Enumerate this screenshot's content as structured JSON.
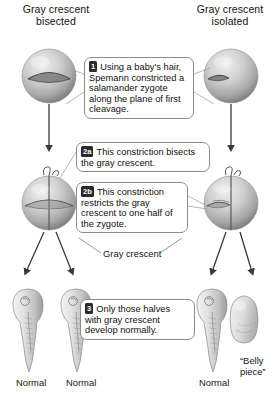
{
  "figure": {
    "title_left": "Gray crescent bisected",
    "title_right": "Gray crescent isolated",
    "header_left_line1": "Gray crescent",
    "header_left_line2": "bisected",
    "header_right_line1": "Gray crescent",
    "header_right_line2": "isolated"
  },
  "steps": [
    {
      "id": "step-1",
      "badge": "1",
      "text": "Using a baby's hair, Spemann constricted a salamander zygote along the plane of first cleavage."
    },
    {
      "id": "step-2a",
      "badge": "2a",
      "text": "This constriction bisects the gray crescent."
    },
    {
      "id": "step-2b",
      "badge": "2b",
      "text": "This constriction restricts the gray crescent to one half of the zygote."
    },
    {
      "id": "step-3",
      "badge": "3",
      "text": "Only those halves with gray crescent develop normally."
    }
  ],
  "labels": {
    "gray_crescent": "Gray crescent",
    "normal_left_1": "Normal",
    "normal_left_2": "Normal",
    "normal_right": "Normal",
    "belly_piece": "“Belly piece”"
  },
  "colors": {
    "zygote_light": "#e8e8e8",
    "zygote_mid": "#b9b9b9",
    "zygote_dark": "#8a8a8a",
    "crescent": "#6f6f6f",
    "arrow": "#3a3a3a",
    "callout_border": "#8d8d8d",
    "badge_bg": "#2a2a2a",
    "text": "#111111",
    "background": "#ffffff"
  },
  "icons": {
    "arrow_down": "arrow-down-icon",
    "hair_loop": "hair-loop-icon"
  }
}
